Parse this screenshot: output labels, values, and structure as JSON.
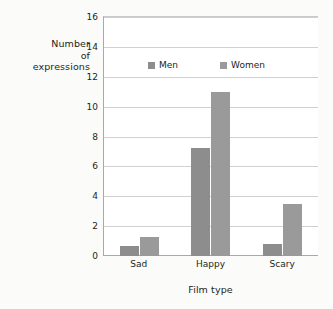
{
  "chart_data": {
    "type": "bar",
    "title": "",
    "subtitle": "",
    "xlabel": "Film type",
    "ylabel": "Number of expressions",
    "ylabel_lines": [
      "Number",
      "of",
      "expressions"
    ],
    "categories": [
      "Sad",
      "Happy",
      "Scary"
    ],
    "series": [
      {
        "name": "Men",
        "values": [
          0.7,
          7.2,
          0.8
        ],
        "color": "#8d8d8d"
      },
      {
        "name": "Women",
        "values": [
          1.3,
          11.0,
          3.5
        ],
        "color": "#9a9a9a"
      }
    ],
    "ylim": [
      0,
      16
    ],
    "ytick_step": 2,
    "yticks": [
      0,
      2,
      4,
      6,
      8,
      10,
      12,
      14,
      16
    ],
    "ytick_labels": [
      "0",
      "2",
      "4",
      "6",
      "8",
      "10",
      "12",
      "14",
      "16"
    ],
    "grid": true,
    "grid_axis": "y",
    "legend_position": "top-center-inside",
    "legend_entries": [
      "Men",
      "Women"
    ],
    "background_color": "#fbfbf9",
    "plot_background_color": "#ffffff",
    "grid_color": "#d0d0d0",
    "axis_color": "#a9a9a9",
    "text_color": "#231f20"
  }
}
